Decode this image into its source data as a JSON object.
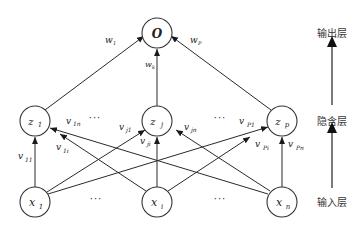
{
  "diagram": {
    "type": "neural-network",
    "nodes": {
      "output": {
        "label": "O"
      },
      "hidden": [
        {
          "label": "z",
          "sub": "1"
        },
        {
          "label": "z",
          "sub": "j"
        },
        {
          "label": "z",
          "sub": "p"
        }
      ],
      "input": [
        {
          "label": "x",
          "sub": "1"
        },
        {
          "label": "x",
          "sub": "i"
        },
        {
          "label": "x",
          "sub": "n"
        }
      ]
    },
    "ellipsis": "···",
    "weights_output": [
      {
        "label": "w",
        "sub": "1"
      },
      {
        "label": "w",
        "sub": "k"
      },
      {
        "label": "w",
        "sub": "P"
      }
    ],
    "weights_hidden": [
      {
        "label": "v",
        "sub": "11"
      },
      {
        "label": "v",
        "sub": "1i"
      },
      {
        "label": "v",
        "sub": "1n"
      },
      {
        "label": "v",
        "sub": "j1"
      },
      {
        "label": "v",
        "sub": "ji"
      },
      {
        "label": "v",
        "sub": "jn"
      },
      {
        "label": "v",
        "sub": "P1"
      },
      {
        "label": "v",
        "sub": "Pi"
      },
      {
        "label": "v",
        "sub": "Pn"
      }
    ],
    "layers": [
      {
        "label": "输出层"
      },
      {
        "label": "隐含层"
      },
      {
        "label": "输入层"
      }
    ]
  }
}
